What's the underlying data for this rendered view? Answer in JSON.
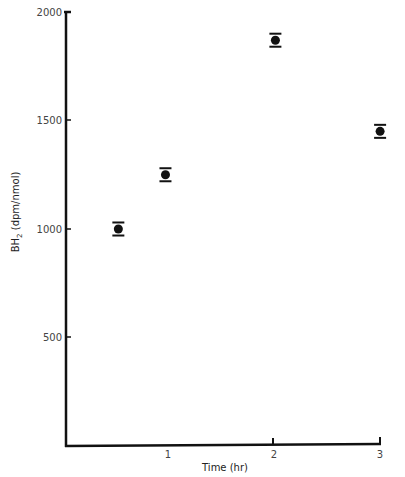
{
  "chart_data": {
    "type": "scatter",
    "title": "",
    "xlabel": "Time (hr)",
    "ylabel": "BH2 (dpm/nmol)",
    "ylabel_main": "BH",
    "ylabel_sub": "2",
    "ylabel_unit": " (dpm/nmol)",
    "xlim": [
      0,
      3
    ],
    "ylim": [
      0,
      2000
    ],
    "x_ticks": [
      "1",
      "2",
      "3"
    ],
    "y_ticks": [
      "500",
      "1000",
      "1500",
      "2000"
    ],
    "grid": false,
    "series": [
      {
        "name": "BH2",
        "x": [
          0.5,
          0.95,
          2.0,
          3.0
        ],
        "y": [
          1000,
          1250,
          1870,
          1450
        ],
        "error": [
          30,
          30,
          30,
          30
        ]
      }
    ]
  }
}
